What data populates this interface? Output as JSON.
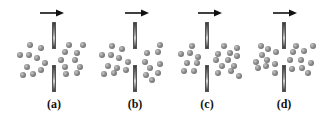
{
  "figure": {
    "panels": [
      {
        "label": "(a)",
        "wall_x": 54,
        "arrow": {
          "x1": 40,
          "x2": 64,
          "y": 13,
          "direction": "right"
        },
        "dots": [
          [
            30,
            45
          ],
          [
            41,
            48
          ],
          [
            20,
            55
          ],
          [
            29,
            55
          ],
          [
            37,
            58
          ],
          [
            45,
            63
          ],
          [
            27,
            67
          ],
          [
            41,
            70
          ],
          [
            23,
            75
          ],
          [
            33,
            74
          ],
          [
            69,
            45
          ],
          [
            83,
            45
          ],
          [
            65,
            52
          ],
          [
            77,
            53
          ],
          [
            61,
            60
          ],
          [
            75,
            60
          ],
          [
            65,
            67
          ],
          [
            80,
            67
          ],
          [
            66,
            74
          ],
          [
            77,
            73
          ]
        ]
      },
      {
        "label": "(b)",
        "wall_x": 135,
        "arrow": {
          "x1": 125,
          "x2": 149,
          "y": 13,
          "direction": "right"
        },
        "dots": [
          [
            112,
            46
          ],
          [
            122,
            49
          ],
          [
            102,
            55
          ],
          [
            111,
            55
          ],
          [
            119,
            58
          ],
          [
            128,
            62
          ],
          [
            108,
            66
          ],
          [
            117,
            68
          ],
          [
            104,
            74
          ],
          [
            114,
            73
          ],
          [
            126,
            70
          ],
          [
            160,
            45
          ],
          [
            147,
            53
          ],
          [
            158,
            52
          ],
          [
            145,
            62
          ],
          [
            150,
            68
          ],
          [
            160,
            64
          ],
          [
            146,
            75
          ],
          [
            158,
            73
          ],
          [
            152,
            80
          ]
        ]
      },
      {
        "label": "(c)",
        "wall_x": 207,
        "arrow": {
          "x1": 198,
          "x2": 222,
          "y": 13,
          "direction": "right"
        },
        "dots": [
          [
            192,
            46
          ],
          [
            181,
            54
          ],
          [
            190,
            53
          ],
          [
            198,
            57
          ],
          [
            187,
            63
          ],
          [
            197,
            63
          ],
          [
            184,
            71
          ],
          [
            194,
            71
          ],
          [
            224,
            46
          ],
          [
            237,
            48
          ],
          [
            218,
            54
          ],
          [
            230,
            53
          ],
          [
            237,
            56
          ],
          [
            216,
            60
          ],
          [
            228,
            60
          ],
          [
            222,
            66
          ],
          [
            234,
            66
          ],
          [
            218,
            73
          ],
          [
            231,
            71
          ],
          [
            239,
            76
          ]
        ]
      },
      {
        "label": "(d)",
        "wall_x": 284,
        "arrow": {
          "x1": 273,
          "x2": 297,
          "y": 13,
          "direction": "right"
        },
        "dots": [
          [
            261,
            46
          ],
          [
            268,
            49
          ],
          [
            276,
            52
          ],
          [
            262,
            55
          ],
          [
            256,
            62
          ],
          [
            267,
            60
          ],
          [
            275,
            64
          ],
          [
            258,
            68
          ],
          [
            266,
            66
          ],
          [
            275,
            73
          ],
          [
            296,
            46
          ],
          [
            313,
            46
          ],
          [
            293,
            52
          ],
          [
            304,
            51
          ],
          [
            290,
            60
          ],
          [
            301,
            60
          ],
          [
            311,
            63
          ],
          [
            292,
            69
          ],
          [
            302,
            68
          ],
          [
            308,
            73
          ]
        ]
      }
    ],
    "wall": {
      "top_segment": [
        22,
        49
      ],
      "bottom_segment": [
        65,
        92
      ],
      "width": 4
    },
    "colors": {
      "dot": "#7a7a7a",
      "wall": "#8a8a8a",
      "arrow": "#111111",
      "label": "#111111"
    }
  }
}
